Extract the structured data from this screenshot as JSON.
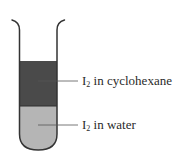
{
  "diagram": {
    "colors": {
      "upper_layer": "#4a4a4a",
      "lower_layer": "#b5b5b5",
      "outline": "#333333",
      "leader": "#555555"
    },
    "labels": [
      {
        "symbol": "I",
        "subscript": "2",
        "text": " in cyclohexane"
      },
      {
        "symbol": "I",
        "subscript": "2",
        "text": " in water"
      }
    ]
  }
}
